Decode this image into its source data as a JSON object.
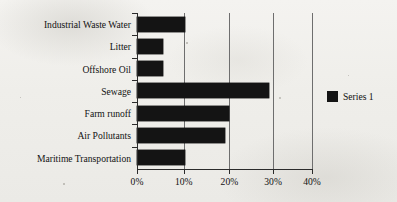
{
  "chart_data": {
    "type": "bar",
    "orientation": "horizontal",
    "title": "",
    "xlabel": "",
    "ylabel": "",
    "categories": [
      "Industrial Waste Water",
      "Litter",
      "Offshore Oil",
      "Sewage",
      "Farm runoff",
      "Air Pollutants",
      "Maritime Transportation"
    ],
    "values": [
      11,
      6,
      6,
      30,
      21,
      20,
      11
    ],
    "series": [
      {
        "name": "Series 1",
        "values": [
          11,
          6,
          6,
          30,
          21,
          20,
          11
        ],
        "color": "#141414"
      }
    ],
    "xlim": [
      0,
      40
    ],
    "xtick_labels": [
      "0%",
      "10%",
      "20%",
      "30%",
      "40%"
    ],
    "xtick_values": [
      0,
      10,
      20,
      30,
      40
    ],
    "grid": "vertical",
    "legend_position": "right",
    "units": "percent"
  },
  "legend": {
    "entries": [
      {
        "label": "Series 1",
        "color": "#141414"
      }
    ]
  },
  "colors": {
    "bar": "#141414",
    "axis": "#2b2b2b",
    "gridline": "#6e6e6e",
    "background": "#f2f1ee",
    "text": "#121212"
  }
}
